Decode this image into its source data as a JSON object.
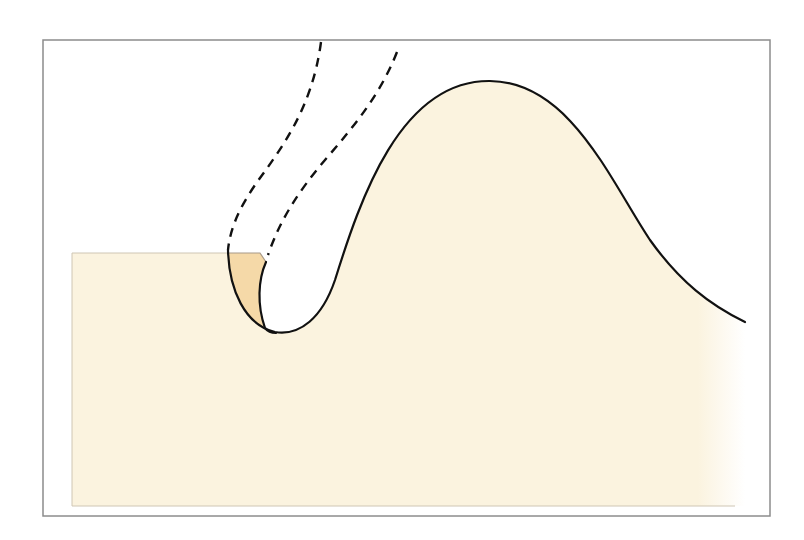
{
  "diagram": {
    "title": "",
    "colors": {
      "background": "#ffffff",
      "frame": "#8c8c8c",
      "base_fill": "#fbf3df",
      "wedge_fill": "#f5d9a8",
      "wedge_edge": "#a89a88",
      "outline": "#111111",
      "dashed": "#111111"
    },
    "frame": {
      "x": 43,
      "y": 40,
      "width": 727,
      "height": 476
    },
    "base_block": {
      "x": 72,
      "y": 253,
      "width": 668,
      "height": 253
    },
    "elements": [
      {
        "id": "profile-curve",
        "type": "solid-curve",
        "description": "surface profile with notch and hump"
      },
      {
        "id": "removed-wedge",
        "type": "shaded-region",
        "description": "shaded sliver removed at notch"
      },
      {
        "id": "dashed-path-outer",
        "type": "dashed-curve"
      },
      {
        "id": "dashed-path-inner",
        "type": "dashed-curve"
      }
    ]
  }
}
